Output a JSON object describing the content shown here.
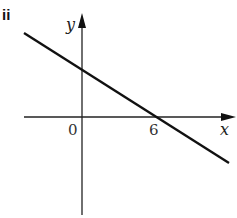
{
  "part_label": "ii",
  "axes": {
    "x_label": "x",
    "y_label": "y",
    "origin_label": "0"
  },
  "ticks": {
    "x_intercept_label": "6"
  },
  "line": {
    "description": "straight line with negative gradient crossing the x-axis at 6 and positive y-intercept",
    "x_intercept": 6
  },
  "colors": {
    "stroke": "#111111",
    "background": "#ffffff"
  }
}
